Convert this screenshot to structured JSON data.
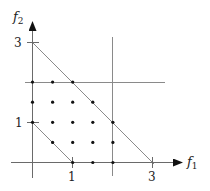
{
  "diagram": {
    "axes": {
      "x_label": "f",
      "x_label_sub": "1",
      "y_label": "f",
      "y_label_sub": "2",
      "x_ticks": [
        {
          "value": 1,
          "label": "1"
        },
        {
          "value": 3,
          "label": "3"
        }
      ],
      "y_ticks": [
        {
          "value": 1,
          "label": "1"
        },
        {
          "value": 3,
          "label": "3"
        }
      ]
    },
    "lines": [
      {
        "name": "outer-diagonal",
        "from": [
          0,
          3
        ],
        "to": [
          3,
          0
        ],
        "description": "f1 + f2 = 3"
      },
      {
        "name": "inner-diagonal",
        "from": [
          0,
          1
        ],
        "to": [
          1,
          0
        ],
        "description": "f1 + f2 = 1"
      },
      {
        "name": "vertical-bound",
        "x": 2,
        "description": "f1 = 2"
      },
      {
        "name": "horizontal-bound",
        "y": 2,
        "description": "f2 = 2"
      }
    ],
    "points": [
      [
        0,
        2
      ],
      [
        0.5,
        2
      ],
      [
        1,
        2
      ],
      [
        0,
        1.5
      ],
      [
        0.5,
        1.5
      ],
      [
        1,
        1.5
      ],
      [
        1.5,
        1.5
      ],
      [
        0,
        1
      ],
      [
        0.5,
        1
      ],
      [
        1,
        1
      ],
      [
        1.5,
        1
      ],
      [
        2,
        1
      ],
      [
        0.5,
        0.5
      ],
      [
        1,
        0.5
      ],
      [
        1.5,
        0.5
      ],
      [
        2,
        0.5
      ],
      [
        1,
        0
      ],
      [
        1.5,
        0
      ],
      [
        2,
        0
      ]
    ],
    "colors": {
      "line": "#8a8a8a",
      "axis": "#6a6a6a",
      "point": "#111111",
      "text": "#222222"
    }
  }
}
